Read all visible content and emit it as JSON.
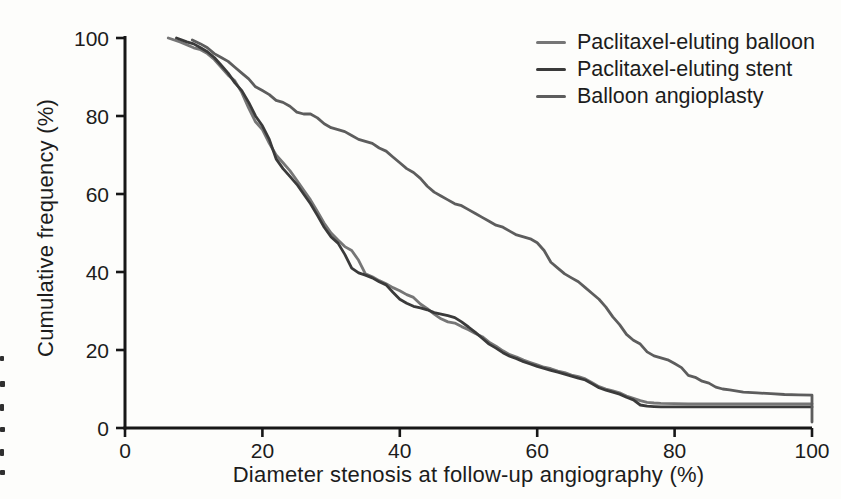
{
  "chart_data": {
    "type": "line",
    "subtype": "cumulative-frequency-distribution",
    "title": "",
    "xlabel": "Diameter stenosis at follow-up angiography (%)",
    "ylabel": "Cumulative frequency (%)",
    "xlim": [
      0,
      100
    ],
    "ylim": [
      0,
      100
    ],
    "x_ticks": [
      0,
      20,
      40,
      60,
      80,
      100
    ],
    "y_ticks": [
      0,
      20,
      40,
      60,
      80,
      100
    ],
    "grid": false,
    "legend_position": "top-right",
    "axis_color": "#171717",
    "series": [
      {
        "name": "Paclitaxel-eluting balloon",
        "color": "#767676",
        "points": [
          [
            6.3,
            100
          ],
          [
            8,
            99
          ],
          [
            10,
            97.5
          ],
          [
            11,
            97
          ],
          [
            12,
            96
          ],
          [
            13,
            94.5
          ],
          [
            14,
            92.5
          ],
          [
            15,
            90.5
          ],
          [
            16,
            89
          ],
          [
            17,
            86
          ],
          [
            18,
            82
          ],
          [
            19,
            78.5
          ],
          [
            20,
            76.5
          ],
          [
            21,
            73
          ],
          [
            22,
            70
          ],
          [
            23,
            68
          ],
          [
            24,
            66
          ],
          [
            25,
            63.5
          ],
          [
            26,
            61
          ],
          [
            27,
            58.5
          ],
          [
            28,
            55.5
          ],
          [
            29,
            52.5
          ],
          [
            30,
            50
          ],
          [
            31,
            48.2
          ],
          [
            32,
            46.5
          ],
          [
            33,
            45.5
          ],
          [
            34,
            43
          ],
          [
            35,
            39.5
          ],
          [
            36,
            38.8
          ],
          [
            37,
            37.8
          ],
          [
            38,
            37
          ],
          [
            39,
            36
          ],
          [
            40,
            35.2
          ],
          [
            41,
            34.2
          ],
          [
            42,
            33.5
          ],
          [
            43,
            31.8
          ],
          [
            44,
            30.6
          ],
          [
            45,
            29.2
          ],
          [
            46,
            28
          ],
          [
            47,
            27.2
          ],
          [
            48,
            26.9
          ],
          [
            49,
            26
          ],
          [
            50,
            25.2
          ],
          [
            51,
            24.2
          ],
          [
            52,
            23.4
          ],
          [
            53,
            22
          ],
          [
            54,
            21
          ],
          [
            55,
            19.8
          ],
          [
            56,
            18.8
          ],
          [
            57,
            18.2
          ],
          [
            58,
            17.4
          ],
          [
            59,
            16.8
          ],
          [
            60,
            16.2
          ],
          [
            61,
            15.6
          ],
          [
            62,
            15.2
          ],
          [
            63,
            14.6
          ],
          [
            64,
            14.2
          ],
          [
            65,
            13.6
          ],
          [
            66,
            13.2
          ],
          [
            67,
            12.6
          ],
          [
            68,
            11.6
          ],
          [
            69,
            10.6
          ],
          [
            70,
            10
          ],
          [
            71,
            9.5
          ],
          [
            72,
            9
          ],
          [
            73,
            8.2
          ],
          [
            74,
            7.6
          ],
          [
            75,
            7
          ],
          [
            76,
            6.6
          ],
          [
            77,
            6.4
          ],
          [
            78,
            6.3
          ],
          [
            82,
            6.2
          ],
          [
            88,
            6.2
          ],
          [
            94,
            6.2
          ],
          [
            100,
            6.2
          ]
        ]
      },
      {
        "name": "Paclitaxel-eluting stent",
        "color": "#3a3a3a",
        "points": [
          [
            7.5,
            100
          ],
          [
            9,
            99
          ],
          [
            10,
            98.5
          ],
          [
            11,
            97.5
          ],
          [
            12,
            96.5
          ],
          [
            13,
            95
          ],
          [
            14,
            93
          ],
          [
            15,
            91
          ],
          [
            16,
            88.5
          ],
          [
            17,
            86.5
          ],
          [
            18,
            83.5
          ],
          [
            19,
            80
          ],
          [
            20,
            77.5
          ],
          [
            21,
            74
          ],
          [
            22,
            69
          ],
          [
            23,
            66.5
          ],
          [
            24,
            64.5
          ],
          [
            25,
            62.5
          ],
          [
            26,
            60
          ],
          [
            27,
            57.5
          ],
          [
            28,
            54.5
          ],
          [
            29,
            51.5
          ],
          [
            30,
            49
          ],
          [
            31,
            47.4
          ],
          [
            32,
            44.5
          ],
          [
            33,
            41
          ],
          [
            34,
            39.8
          ],
          [
            35,
            39.2
          ],
          [
            36,
            38.5
          ],
          [
            37,
            37.5
          ],
          [
            38,
            36.7
          ],
          [
            39,
            34.8
          ],
          [
            40,
            33
          ],
          [
            41,
            32
          ],
          [
            42,
            31.2
          ],
          [
            43,
            30.8
          ],
          [
            44,
            30.3
          ],
          [
            45,
            29.6
          ],
          [
            46,
            29.2
          ],
          [
            47,
            28.8
          ],
          [
            48,
            28.3
          ],
          [
            49,
            27.2
          ],
          [
            50,
            25.9
          ],
          [
            51,
            24.5
          ],
          [
            52,
            23,
            0
          ],
          [
            53,
            21.5
          ],
          [
            54,
            20.5
          ],
          [
            55,
            19.3
          ],
          [
            56,
            18.4
          ],
          [
            57,
            17.8
          ],
          [
            58,
            17
          ],
          [
            59,
            16.4
          ],
          [
            60,
            15.8
          ],
          [
            61,
            15.3
          ],
          [
            62,
            14.8
          ],
          [
            63,
            14.3
          ],
          [
            64,
            13.8
          ],
          [
            65,
            13.3
          ],
          [
            66,
            12.8
          ],
          [
            67,
            12.3
          ],
          [
            68,
            11.3
          ],
          [
            69,
            10.3
          ],
          [
            70,
            9.7
          ],
          [
            71,
            9.2
          ],
          [
            72,
            8.7
          ],
          [
            73,
            7.9
          ],
          [
            74,
            7.2
          ],
          [
            75,
            5.9
          ],
          [
            76,
            5.6
          ],
          [
            77,
            5.5
          ],
          [
            78,
            5.4
          ],
          [
            82,
            5.4
          ],
          [
            88,
            5.4
          ],
          [
            94,
            5.4
          ],
          [
            100,
            5.4
          ]
        ]
      },
      {
        "name": "Balloon angioplasty",
        "color": "#5d5d5d",
        "points": [
          [
            9.8,
            99.5
          ],
          [
            11,
            98.5
          ],
          [
            12,
            97.5
          ],
          [
            13,
            96
          ],
          [
            14,
            95
          ],
          [
            15,
            94
          ],
          [
            16,
            92.5
          ],
          [
            17,
            91
          ],
          [
            18,
            89.5
          ],
          [
            19,
            87.5
          ],
          [
            20,
            86.5
          ],
          [
            21,
            85.5
          ],
          [
            22,
            84
          ],
          [
            23,
            83.5
          ],
          [
            24,
            82.5
          ],
          [
            25,
            81
          ],
          [
            26,
            80.5
          ],
          [
            27,
            80.5
          ],
          [
            28,
            79.5
          ],
          [
            29,
            78
          ],
          [
            30,
            77
          ],
          [
            31,
            76.5
          ],
          [
            32,
            76
          ],
          [
            33,
            75
          ],
          [
            34,
            74
          ],
          [
            35,
            73.5
          ],
          [
            36,
            73
          ],
          [
            37,
            71.8
          ],
          [
            38,
            71
          ],
          [
            39,
            69.5
          ],
          [
            40,
            68
          ],
          [
            41,
            66.5
          ],
          [
            42,
            65.5
          ],
          [
            43,
            64
          ],
          [
            44,
            62
          ],
          [
            45,
            60.5
          ],
          [
            46,
            59.5
          ],
          [
            47,
            58.5
          ],
          [
            48,
            57.5
          ],
          [
            49,
            57
          ],
          [
            50,
            56
          ],
          [
            51,
            55
          ],
          [
            52,
            54
          ],
          [
            53,
            53
          ],
          [
            54,
            52
          ],
          [
            55,
            51.5
          ],
          [
            56,
            50.5
          ],
          [
            57,
            49.5
          ],
          [
            58,
            49
          ],
          [
            59,
            48.5
          ],
          [
            60,
            47.5
          ],
          [
            61,
            45.5
          ],
          [
            62,
            42.5
          ],
          [
            63,
            41
          ],
          [
            64,
            39.5
          ],
          [
            65,
            38.5
          ],
          [
            66,
            37.5
          ],
          [
            67,
            36
          ],
          [
            68,
            34.5
          ],
          [
            69,
            33
          ],
          [
            70,
            31
          ],
          [
            71,
            28.5
          ],
          [
            72,
            26.5
          ],
          [
            73,
            24
          ],
          [
            74,
            22.5
          ],
          [
            75,
            21.5
          ],
          [
            76,
            19.5
          ],
          [
            77,
            18.5
          ],
          [
            78,
            18
          ],
          [
            79,
            17.5
          ],
          [
            80,
            16.5
          ],
          [
            81,
            15.5
          ],
          [
            82,
            13.5
          ],
          [
            83,
            13
          ],
          [
            84,
            12
          ],
          [
            85,
            11.5
          ],
          [
            86,
            10.5
          ],
          [
            87,
            10
          ],
          [
            88,
            9.8
          ],
          [
            90,
            9.2
          ],
          [
            92,
            9
          ],
          [
            94,
            8.8
          ],
          [
            96,
            8.6
          ],
          [
            98,
            8.5
          ],
          [
            100,
            8.4
          ],
          [
            100,
            1.5
          ]
        ]
      }
    ]
  }
}
